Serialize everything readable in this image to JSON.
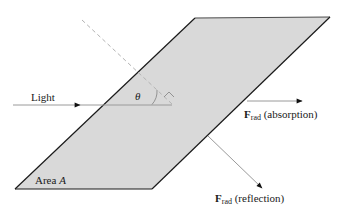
{
  "diagram": {
    "labels": {
      "light": "Light",
      "theta": "θ",
      "area_prefix": "Area ",
      "area_symbol": "A",
      "force_symbol": "F",
      "force_subscript": "rad",
      "absorption": " (absorption)",
      "reflection": " (reflection)"
    },
    "colors": {
      "surface_fill": "#d9d9d9",
      "surface_edge": "#1a1a1a",
      "normal_dashed": "#b3b3b3",
      "ray": "#9a9a9a",
      "arrowhead": "#111111"
    }
  }
}
